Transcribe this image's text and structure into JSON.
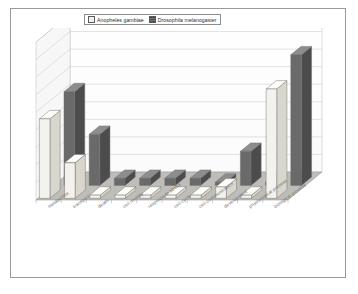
{
  "figure": {
    "background": "#ffffff",
    "border_color": "#9a9a9a"
  },
  "legend": {
    "position": "top-center",
    "entries": [
      {
        "label": "Anopheles gambiae",
        "swatch": "light",
        "color": "#f2f0ea"
      },
      {
        "label": "Drosophila melanogaster",
        "swatch": "dark",
        "color": "#5d5d5d"
      }
    ]
  },
  "chart_data": {
    "type": "bar",
    "title": "",
    "subtitle": "",
    "xlabel": "",
    "ylabel": "",
    "style": "3d-clustered-column",
    "grid": true,
    "gridlines": 9,
    "legend_position": "top",
    "ylim": [
      0,
      100
    ],
    "categories": [
      "metabolism",
      "transport",
      "death",
      "cell motility",
      "response to stress",
      "cell cycle",
      "cell communication",
      "development",
      "physiological process",
      "biological process"
    ],
    "series": [
      {
        "name": "Anopheles gambiae",
        "color": "#f2f0ea",
        "values": [
          56,
          25,
          1,
          1,
          1,
          1,
          1,
          8,
          1,
          77
        ]
      },
      {
        "name": "Drosophila melanogaster",
        "color": "#5d5d5d",
        "values": [
          66,
          36,
          5,
          5,
          5,
          5,
          1,
          24,
          1,
          92
        ]
      }
    ]
  },
  "axis": {
    "tick_labels": [
      "metabolism",
      "transport",
      "death",
      "cell motility",
      "response to stress",
      "cell cycle",
      "cell communication",
      "development",
      "physiological process",
      "biological process"
    ]
  }
}
